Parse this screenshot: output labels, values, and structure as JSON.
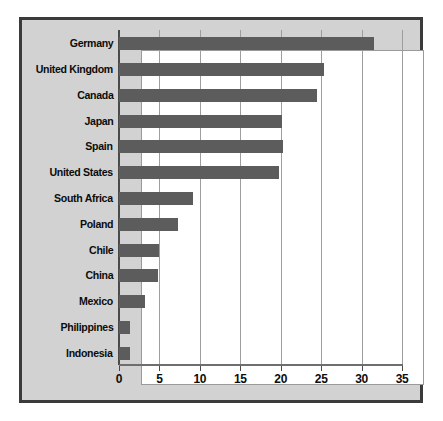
{
  "chart_data": {
    "type": "bar",
    "orientation": "horizontal",
    "title": "",
    "subtitle": "",
    "xlabel": "",
    "ylabel": "",
    "categories": [
      "Germany",
      "United Kingdom",
      "Canada",
      "Japan",
      "Spain",
      "United States",
      "South Africa",
      "Poland",
      "Chile",
      "China",
      "Mexico",
      "Philippines",
      "Indonesia"
    ],
    "values": [
      31.5,
      25.4,
      24.5,
      20.2,
      20.3,
      19.8,
      9.2,
      7.3,
      4.9,
      4.8,
      3.2,
      1.3,
      1.3
    ],
    "xlim": [
      0,
      35
    ],
    "xticks": [
      0,
      5,
      10,
      15,
      20,
      25,
      30,
      35
    ],
    "xtick_labels": [
      "0",
      "5",
      "10",
      "15",
      "20",
      "25",
      "30",
      "35"
    ],
    "grid": true,
    "grid_axis": "x",
    "legend": false,
    "legend_position": "none",
    "bar_color": "#5c5c5c",
    "plot_background": "#ffffff",
    "panel_background": "#d2d2d2",
    "frame_color": "#3b3b3b",
    "gridline_color": "#9e9e9e",
    "axis_color": "#4a4a4a",
    "label_color": "#0c0c0c"
  }
}
